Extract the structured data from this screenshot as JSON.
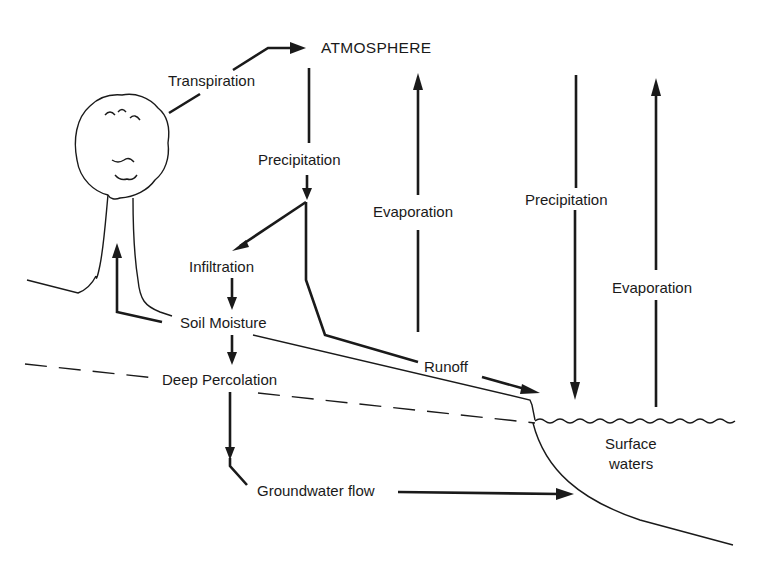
{
  "diagram": {
    "nodes": {
      "atmosphere": "ATMOSPHERE",
      "transpiration": "Transpiration",
      "precipitation_land": "Precipitation",
      "evaporation_land": "Evaporation",
      "precipitation_water": "Precipitation",
      "evaporation_water": "Evaporation",
      "infiltration": "Infiltration",
      "soil_moisture": "Soil Moisture",
      "deep_percolation": "Deep Percolation",
      "runoff": "Runoff",
      "groundwater_flow": "Groundwater flow",
      "surface_waters_line1": "Surface",
      "surface_waters_line2": "waters"
    },
    "edges": [
      {
        "from": "tree",
        "to": "atmosphere",
        "label": "Transpiration"
      },
      {
        "from": "atmosphere",
        "to": "land",
        "label": "Precipitation"
      },
      {
        "from": "land",
        "to": "atmosphere",
        "label": "Evaporation"
      },
      {
        "from": "atmosphere",
        "to": "surface_waters",
        "label": "Precipitation"
      },
      {
        "from": "surface_waters",
        "to": "atmosphere",
        "label": "Evaporation"
      },
      {
        "from": "precipitation",
        "to": "soil",
        "label": "Infiltration"
      },
      {
        "from": "infiltration",
        "to": "soil_moisture"
      },
      {
        "from": "soil_moisture",
        "to": "tree"
      },
      {
        "from": "soil_moisture",
        "to": "deep_percolation"
      },
      {
        "from": "deep_percolation",
        "to": "groundwater",
        "label": "Groundwater flow"
      },
      {
        "from": "groundwater",
        "to": "surface_waters"
      },
      {
        "from": "precipitation",
        "to": "surface_waters",
        "label": "Runoff"
      }
    ],
    "icons": [
      "tree-icon",
      "water-surface-wave"
    ],
    "colors": {
      "ink": "#1a1a1a",
      "background": "#ffffff"
    }
  }
}
